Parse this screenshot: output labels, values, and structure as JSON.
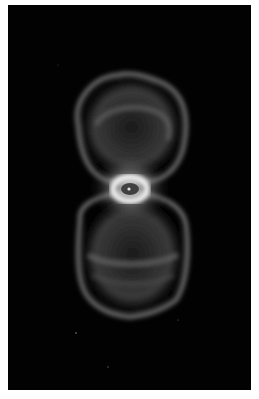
{
  "image": {
    "subject": "hourglass-shaped planetary nebula",
    "colors": {
      "background": "#020202",
      "border": "#ffffff",
      "nebula_glow": "#9a9a9a",
      "ring": "#f0f0f0",
      "core": "#3a3a3a"
    }
  }
}
